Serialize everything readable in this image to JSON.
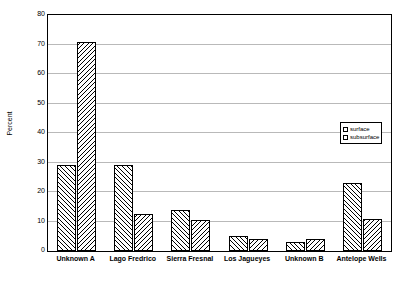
{
  "chart_data": {
    "type": "bar",
    "title": "",
    "xlabel": "",
    "ylabel": "Percent",
    "ylim": [
      0,
      80
    ],
    "yticks": [
      0,
      10,
      20,
      30,
      40,
      50,
      60,
      70,
      80
    ],
    "ytick_labels": [
      "0",
      "10",
      "20",
      "30",
      "40",
      "50",
      "60",
      "70",
      "80"
    ],
    "grid": true,
    "legend_position": "right-middle",
    "categories": [
      "Unknown A",
      "Lago Fredrico",
      "Sierra Fresnal",
      "Los Jagueyes",
      "Unknown B",
      "Antelope Wells"
    ],
    "series": [
      {
        "name": "surface",
        "values": [
          29,
          29,
          14,
          5,
          3,
          23
        ]
      },
      {
        "name": "subsurface",
        "values": [
          71,
          12.5,
          10.5,
          4,
          4,
          11
        ]
      }
    ]
  },
  "axes": {
    "y_title": "Percent"
  },
  "legend": {
    "items": [
      {
        "label": "surface"
      },
      {
        "label": "subsurface"
      }
    ]
  }
}
